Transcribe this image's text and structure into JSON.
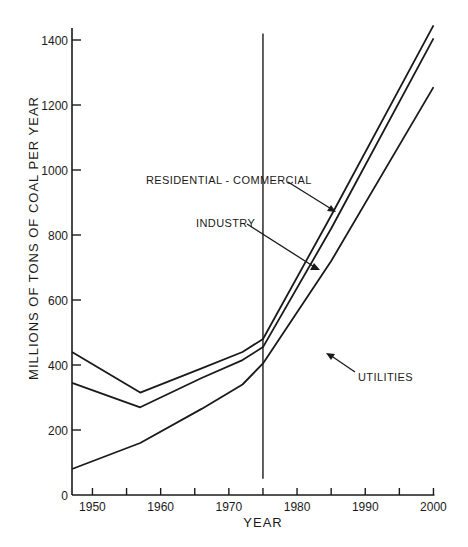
{
  "chart_data": {
    "type": "area",
    "stacked": true,
    "title": "",
    "xlabel": "YEAR",
    "ylabel": "MILLIONS OF TONS OF COAL PER YEAR",
    "xlim": [
      1947,
      2000
    ],
    "ylim": [
      0,
      1450
    ],
    "x_ticks": [
      1950,
      1955,
      1960,
      1965,
      1970,
      1975,
      1980,
      1985,
      1990,
      1995,
      2000
    ],
    "x_tick_labels": [
      "1950",
      "1960",
      "1970",
      "1980",
      "1990",
      "2000"
    ],
    "y_ticks": [
      0,
      200,
      400,
      600,
      800,
      1000,
      1200,
      1400
    ],
    "y_tick_labels": [
      "0",
      "200",
      "400",
      "600",
      "800",
      "1000",
      "1200",
      "1400"
    ],
    "grid": false,
    "legend": "inline annotations with arrows",
    "reference_line": {
      "x": 1975,
      "y_from": 50,
      "y_to": 1420
    },
    "x": [
      1947,
      1957,
      1966,
      1972,
      1975,
      1985,
      2000
    ],
    "cumulative_lines": [
      {
        "name": "Utilities (upper boundary of bottom band)",
        "values": [
          80,
          160,
          265,
          340,
          405,
          720,
          1255
        ]
      },
      {
        "name": "Utilities + Industry",
        "values": [
          345,
          270,
          360,
          415,
          455,
          820,
          1405
        ]
      },
      {
        "name": "Utilities + Industry + Residential-Commercial (total)",
        "values": [
          440,
          315,
          390,
          440,
          480,
          860,
          1445
        ]
      }
    ],
    "series": [
      {
        "name": "UTILITIES",
        "values": [
          80,
          160,
          265,
          340,
          405,
          720,
          1255
        ]
      },
      {
        "name": "INDUSTRY",
        "values": [
          265,
          110,
          95,
          75,
          50,
          100,
          150
        ]
      },
      {
        "name": "RESIDENTIAL - COMMERCIAL",
        "values": [
          95,
          45,
          30,
          25,
          25,
          40,
          40
        ]
      }
    ],
    "annotations": [
      {
        "text": "RESIDENTIAL - COMMERCIAL",
        "points_to": "band between total line and Utilities+Industry line, ~1985"
      },
      {
        "text": "INDUSTRY",
        "points_to": "band between Utilities+Industry line and Utilities line, ~1984"
      },
      {
        "text": "UTILITIES",
        "points_to": "area under bottom line, ~1980"
      }
    ]
  },
  "labels": {
    "ylabel": "MILLIONS OF TONS OF COAL PER YEAR",
    "xlabel": "YEAR",
    "res_comm": "RESIDENTIAL - COMMERCIAL",
    "industry": "INDUSTRY",
    "utilities": "UTILITIES"
  },
  "colors": {
    "ink": "#1a1a1a",
    "background": "#ffffff"
  }
}
